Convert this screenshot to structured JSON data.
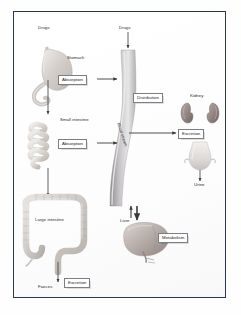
{
  "diagram": {
    "frame_color": "#2b3558",
    "background_color": "#ffffff"
  },
  "labels": {
    "drugs_oral": "Drugs",
    "drugs_iv": "Drugs",
    "stomach": "Stomach",
    "small_intestine": "Small intestine",
    "large_intestine": "Large intestine",
    "faeces": "Faeces",
    "kidney": "Kidney",
    "urine": "Urine",
    "liver": "Liver",
    "blood_stream": "Blood stream"
  },
  "boxes": {
    "absorption_stomach": "Absorption",
    "absorption_intestine": "Absorption",
    "distribution": "Distribution",
    "excretion_kidney": "Excretion",
    "excretion_faeces": "Excretion",
    "metabolism": "Metabolism"
  },
  "organs": {
    "stomach_color": "#cfc9c4",
    "intestine_color": "#d2cdc8",
    "colon_color": "#c9c4c0",
    "kidney_color": "#9b8f8c",
    "bladder_color": "#e0dcd9",
    "liver_color": "#b8aeaa",
    "vessel_color": "#a8a6a8"
  }
}
